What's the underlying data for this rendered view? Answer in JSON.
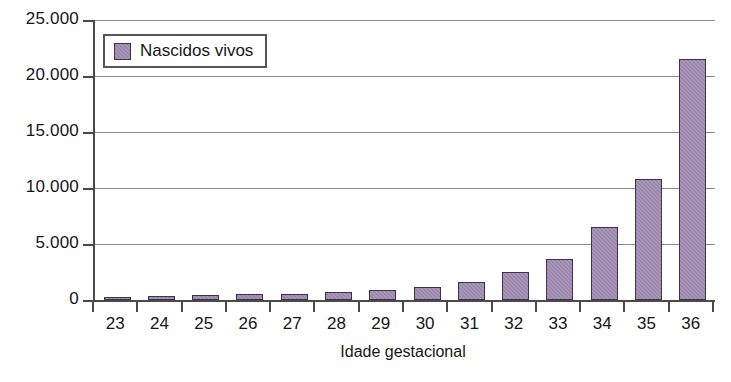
{
  "chart_data": {
    "type": "bar",
    "title": "",
    "subtitle": "",
    "xlabel": "Idade gestacional",
    "ylabel": "",
    "categories": [
      "23",
      "24",
      "25",
      "26",
      "27",
      "28",
      "29",
      "30",
      "31",
      "32",
      "33",
      "34",
      "35",
      "36"
    ],
    "values": [
      250,
      350,
      420,
      500,
      550,
      750,
      900,
      1150,
      1600,
      2500,
      3700,
      6500,
      10800,
      21500
    ],
    "series": [
      {
        "name": "Nascidos vivos",
        "color": "#9b86ad",
        "values": [
          250,
          350,
          420,
          500,
          550,
          750,
          900,
          1150,
          1600,
          2500,
          3700,
          6500,
          10800,
          21500
        ]
      }
    ],
    "ylim": [
      0,
      25000
    ],
    "ytick_values": [
      0,
      5000,
      10000,
      15000,
      20000,
      25000
    ],
    "ytick_labels": [
      "0",
      "5.000",
      "10.000",
      "15.000",
      "20.000",
      "25.000"
    ],
    "grid": true,
    "grid_axis": "y",
    "legend": {
      "position": "top-left-inside",
      "entries": [
        {
          "label": "Nascidos vivos",
          "color": "#9b86ad"
        }
      ]
    },
    "colors": {
      "bar_fill": "#9b86ad",
      "bar_border": "#3d3347",
      "axis": "#4a4a4a",
      "gridline": "#8c8c8c",
      "text": "#161616",
      "background": "#ffffff"
    }
  }
}
